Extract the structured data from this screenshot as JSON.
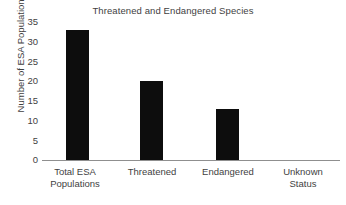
{
  "chart_data": {
    "type": "bar",
    "title": "Threatened and Endangered Species",
    "xlabel": "",
    "ylabel": "Number of ESA Populations",
    "categories": [
      "Total ESA Populations",
      "Threatened",
      "Endangered",
      "Unknown Status"
    ],
    "category_lines": [
      [
        "Total ESA",
        "Populations"
      ],
      [
        "Threatened",
        ""
      ],
      [
        "Endangered",
        ""
      ],
      [
        "Unknown",
        "Status"
      ]
    ],
    "values": [
      33,
      20,
      13,
      0
    ],
    "ylim": [
      0,
      35
    ],
    "yticks": [
      35,
      30,
      25,
      20,
      15,
      10,
      5,
      0
    ],
    "ytick_labels": [
      "35",
      "30",
      "25",
      "20",
      "15",
      "10",
      "5",
      "0"
    ],
    "grid": false,
    "legend": "none",
    "bar_color": "#0d0d0d",
    "axis_color": "#8f8f8f",
    "text_color": "#3f3f3f",
    "background": "#ffffff"
  }
}
